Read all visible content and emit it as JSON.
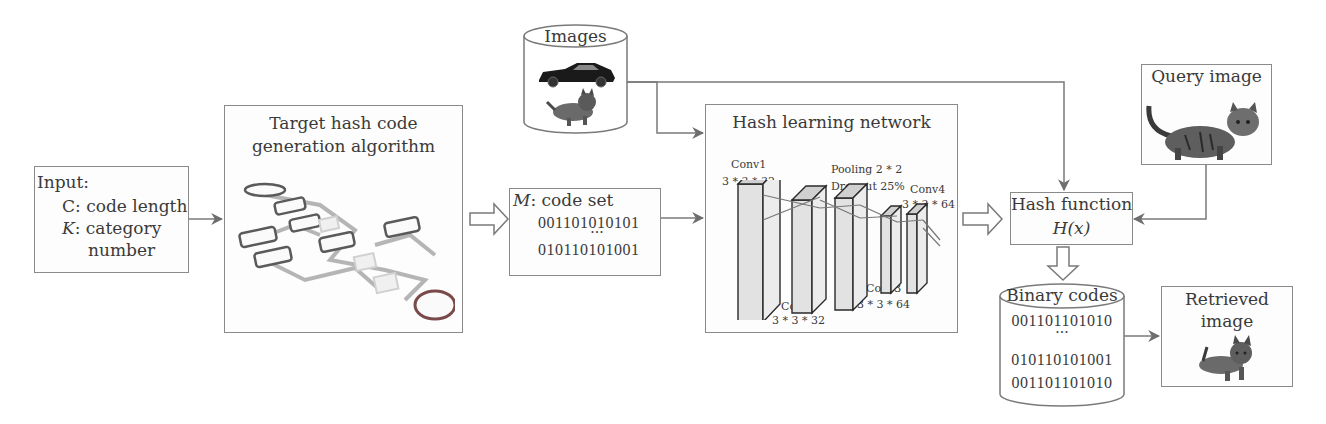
{
  "input": {
    "title": "Input:",
    "c_var": "C",
    "c_label": ": code length",
    "k_var": "K",
    "k_label": ": category",
    "k_label2": "number"
  },
  "target": {
    "title_line1": "Target hash code",
    "title_line2": "generation algorithm",
    "icon": "flowchart-icon"
  },
  "code_set": {
    "var": "M",
    "label": ": code set",
    "codes": [
      "001101010101",
      "···",
      "010110101001"
    ]
  },
  "images_db": {
    "title": "Images",
    "contents": [
      "car-image",
      "cat-image"
    ]
  },
  "network": {
    "title": "Hash learning network",
    "layers": [
      {
        "name": "Conv1",
        "spec": "3 * 3 * 32"
      },
      {
        "name": "Conv2",
        "spec": "3 * 3 * 32"
      },
      {
        "name": "Pooling 2 * 2",
        "spec": "Dropout 25%"
      },
      {
        "name": "Conv3",
        "spec": "3 * 3 * 64"
      },
      {
        "name": "Conv4",
        "spec": "3 * 3 * 64"
      }
    ]
  },
  "hash_function": {
    "title": "Hash function",
    "formula": "H(x)"
  },
  "query": {
    "title": "Query image"
  },
  "binary_db": {
    "title": "Binary codes",
    "codes": [
      "001101101010",
      "···",
      "010110101001",
      "001101101010"
    ]
  },
  "retrieved": {
    "title_line1": "Retrieved",
    "title_line2": "image"
  },
  "colors": {
    "line": "#7a7a7a",
    "box_border": "#8a8a8a",
    "layer_fill": "#e2e2e2",
    "text": "#3a3a3a"
  }
}
